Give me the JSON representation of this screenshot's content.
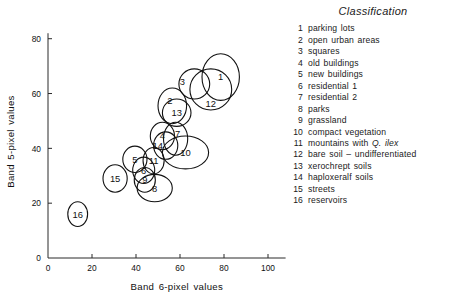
{
  "chart_data": {
    "type": "scatter",
    "title": "",
    "xlabel": "Band 6-pixel values",
    "ylabel": "Band 5-pixel values",
    "xlim": [
      0,
      110
    ],
    "ylim": [
      0,
      85
    ],
    "xticks": [
      0,
      20,
      40,
      60,
      80,
      100
    ],
    "yticks": [
      0,
      20,
      40,
      60,
      80
    ],
    "grid": false,
    "legend_position": "right",
    "marker_shape": "ellipse",
    "note": "Each numbered ellipse is a class cluster (centroid with spread) in Band 6 / Band 5 feature space.",
    "ellipses": [
      {
        "id": 1,
        "label": "1",
        "x": 78.5,
        "y": 66.0,
        "rx": 8.5,
        "ry": 8.5,
        "label_dx": 0,
        "label_dy": 0
      },
      {
        "id": 2,
        "label": "2",
        "x": 56.5,
        "y": 55.5,
        "rx": 6.5,
        "ry": 6.5,
        "label_dx": -2.5,
        "label_dy": 4.0
      },
      {
        "id": 3,
        "label": "3",
        "x": 66.5,
        "y": 63.5,
        "rx": 7.0,
        "ry": 5.5,
        "label_dx": -12.0,
        "label_dy": 2.0
      },
      {
        "id": 4,
        "label": "4",
        "x": 52.0,
        "y": 44.5,
        "rx": 5.5,
        "ry": 5.0,
        "label_dx": 0,
        "label_dy": 0
      },
      {
        "id": 5,
        "label": "5",
        "x": 39.5,
        "y": 36.0,
        "rx": 5.5,
        "ry": 4.8,
        "label_dx": 0,
        "label_dy": 0
      },
      {
        "id": 6,
        "label": "6",
        "x": 43.5,
        "y": 32.0,
        "rx": 5.0,
        "ry": 4.8,
        "label_dx": 0,
        "label_dy": 0
      },
      {
        "id": 7,
        "label": "7",
        "x": 58.0,
        "y": 43.5,
        "rx": 5.5,
        "ry": 6.0,
        "label_dx": 2.0,
        "label_dy": 4.0
      },
      {
        "id": 8,
        "label": "8",
        "x": 48.5,
        "y": 25.5,
        "rx": 8.0,
        "ry": 5.0,
        "label_dx": 0,
        "label_dy": 0
      },
      {
        "id": 9,
        "label": "9",
        "x": 44.0,
        "y": 28.5,
        "rx": 4.8,
        "ry": 4.5,
        "label_dx": 0,
        "label_dy": 0
      },
      {
        "id": 10,
        "label": "10",
        "x": 62.5,
        "y": 38.5,
        "rx": 10.5,
        "ry": 6.0,
        "label_dx": 0,
        "label_dy": 0
      },
      {
        "id": 11,
        "label": "11",
        "x": 48.0,
        "y": 35.5,
        "rx": 4.8,
        "ry": 4.8,
        "label_dx": 0,
        "label_dy": 0
      },
      {
        "id": 12,
        "label": "12",
        "x": 74.0,
        "y": 61.5,
        "rx": 9.5,
        "ry": 7.5,
        "label_dx": 0,
        "label_dy": -11.0
      },
      {
        "id": 13,
        "label": "13",
        "x": 58.5,
        "y": 53.0,
        "rx": 6.5,
        "ry": 5.0,
        "label_dx": 0,
        "label_dy": 0
      },
      {
        "id": 14,
        "label": "14",
        "x": 53.5,
        "y": 41.0,
        "rx": 5.5,
        "ry": 5.0,
        "label_dx": -8.0,
        "label_dy": 0
      },
      {
        "id": 15,
        "label": "15",
        "x": 30.5,
        "y": 29.0,
        "rx": 5.5,
        "ry": 5.0,
        "label_dx": 0,
        "label_dy": 0
      },
      {
        "id": 16,
        "label": "16",
        "x": 13.5,
        "y": 16.0,
        "rx": 4.5,
        "ry": 4.5,
        "label_dx": 0,
        "label_dy": 0
      }
    ]
  },
  "legend": {
    "title": "Classification",
    "items": [
      {
        "num": "1",
        "text": "parking lots",
        "italic_tail": ""
      },
      {
        "num": "2",
        "text": "open urban areas",
        "italic_tail": ""
      },
      {
        "num": "3",
        "text": "squares",
        "italic_tail": ""
      },
      {
        "num": "4",
        "text": "old buildings",
        "italic_tail": ""
      },
      {
        "num": "5",
        "text": "new buildings",
        "italic_tail": ""
      },
      {
        "num": "6",
        "text": "residential 1",
        "italic_tail": ""
      },
      {
        "num": "7",
        "text": "residential 2",
        "italic_tail": ""
      },
      {
        "num": "8",
        "text": "parks",
        "italic_tail": ""
      },
      {
        "num": "9",
        "text": "grassland",
        "italic_tail": ""
      },
      {
        "num": "10",
        "text": "compact vegetation",
        "italic_tail": ""
      },
      {
        "num": "11",
        "text": "mountains with ",
        "italic_tail": "Q. ilex"
      },
      {
        "num": "12",
        "text": "bare soil – undifferentiated",
        "italic_tail": ""
      },
      {
        "num": "13",
        "text": "xerochrept soils",
        "italic_tail": ""
      },
      {
        "num": "14",
        "text": "haploxeralf soils",
        "italic_tail": ""
      },
      {
        "num": "15",
        "text": "streets",
        "italic_tail": ""
      },
      {
        "num": "16",
        "text": "reservoirs",
        "italic_tail": ""
      }
    ]
  },
  "colors": {
    "ink": "#111111",
    "axis": "#2a2a2a",
    "background": "#ffffff"
  }
}
